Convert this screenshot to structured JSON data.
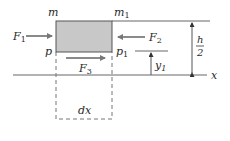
{
  "diagram": {
    "colors": {
      "element_fill": "#c8c8c8",
      "element_stroke": "#555555",
      "line": "#666666",
      "arrow": "#8a8a8a",
      "text": "#2a2a2a"
    },
    "labels": {
      "m": "m",
      "m1_base": "m",
      "m1_sub": "1",
      "p": "p",
      "p1_base": "p",
      "p1_sub": "1",
      "F1_base": "F",
      "F1_sub": "1",
      "F2_base": "F",
      "F2_sub": "2",
      "F3_base": "F",
      "F3_sub": "3",
      "h_num": "h",
      "h_den": "2",
      "y1_base": "y",
      "y1_sub": "1",
      "x_axis": "x",
      "dx": "dx"
    }
  }
}
